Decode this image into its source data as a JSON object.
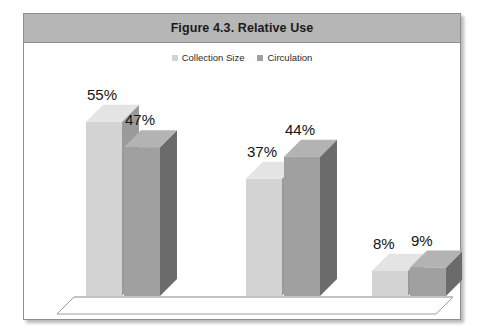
{
  "figure": {
    "title": "Figure 4.3.  Relative Use"
  },
  "legend": {
    "position": "top-center",
    "items": [
      {
        "label": "Collection Size",
        "color": "#d3d3d3",
        "icon": "square-swatch"
      },
      {
        "label": "Circulation",
        "color": "#a0a0a0",
        "icon": "square-swatch"
      }
    ]
  },
  "chart_data": {
    "type": "bar",
    "title": "Figure 4.3.  Relative Use",
    "xlabel": "",
    "ylabel": "",
    "ylim": [
      0,
      60
    ],
    "grid": false,
    "style": "3d-clustered-column",
    "categories": [
      "Adult",
      "Children's",
      "Teen"
    ],
    "series": [
      {
        "name": "Collection Size",
        "color": "#d3d3d3",
        "values": [
          55,
          37,
          8
        ],
        "labels": [
          "55%",
          "37%",
          "8%"
        ]
      },
      {
        "name": "Circulation",
        "color": "#a0a0a0",
        "values": [
          47,
          44,
          9
        ],
        "labels": [
          "47%",
          "44%",
          "9%"
        ]
      }
    ]
  },
  "colors": {
    "title_bar": "#b6b6b6",
    "frame_border": "#8e8e8e",
    "series_light_front": "#d3d3d3",
    "series_light_top": "#e4e4e4",
    "series_light_side": "#9a9a9a",
    "series_dark_front": "#a0a0a0",
    "series_dark_top": "#b3b3b3",
    "series_dark_side": "#6b6b6b",
    "floor_line": "#9d9d9d",
    "gridline": "#b9b9b9"
  }
}
